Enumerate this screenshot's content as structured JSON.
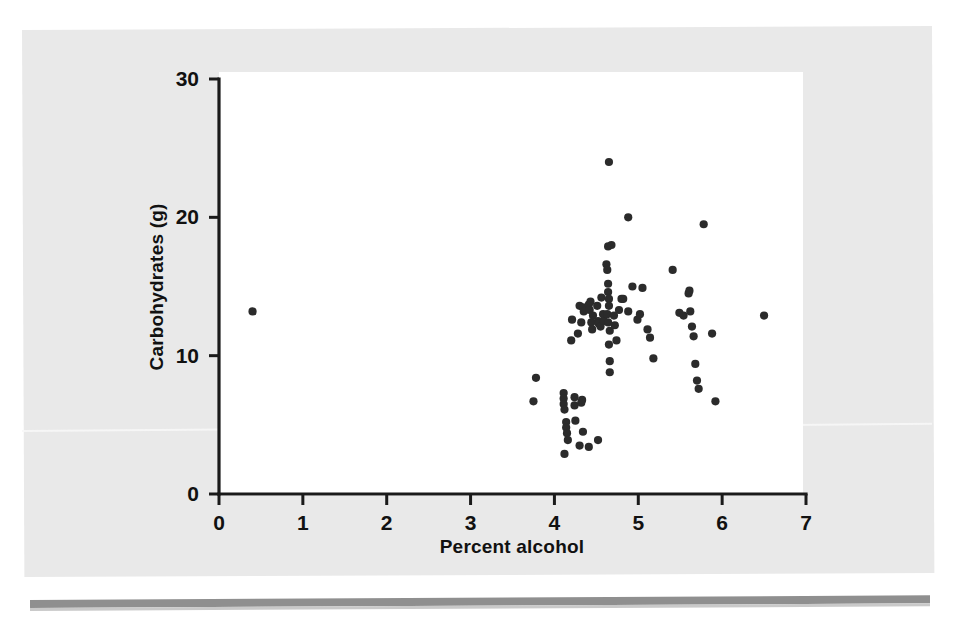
{
  "figure": {
    "background_color": "#e9e9e9",
    "plot_background_color": "#ffffff",
    "point_color": "#2b2b2b",
    "axis_color": "#1a1a1a"
  },
  "axes": {
    "x_title": "Percent alcohol",
    "y_title": "Carbohydrates (g)",
    "x_ticks": [
      "0",
      "1",
      "2",
      "3",
      "4",
      "5",
      "6",
      "7"
    ],
    "y_ticks": [
      "0",
      "10",
      "20",
      "30"
    ]
  },
  "chart_data": {
    "type": "scatter",
    "title": "",
    "xlabel": "Percent alcohol",
    "ylabel": "Carbohydrates (g)",
    "xlim": [
      0,
      7
    ],
    "ylim": [
      0,
      30
    ],
    "xticks": [
      0,
      1,
      2,
      3,
      4,
      5,
      6,
      7
    ],
    "yticks": [
      0,
      10,
      20,
      30
    ],
    "grid": false,
    "legend": "none",
    "marker": "filled-circle",
    "n_points": 86,
    "points": [
      [
        0.4,
        13.2
      ],
      [
        3.78,
        8.4
      ],
      [
        3.75,
        6.7
      ],
      [
        4.11,
        7.3
      ],
      [
        4.11,
        6.9
      ],
      [
        4.11,
        6.5
      ],
      [
        4.12,
        6.1
      ],
      [
        4.14,
        5.2
      ],
      [
        4.14,
        4.8
      ],
      [
        4.15,
        4.4
      ],
      [
        4.16,
        3.9
      ],
      [
        4.12,
        2.9
      ],
      [
        4.24,
        7.0
      ],
      [
        4.24,
        6.4
      ],
      [
        4.25,
        5.3
      ],
      [
        4.32,
        6.6
      ],
      [
        4.33,
        6.8
      ],
      [
        4.34,
        4.5
      ],
      [
        4.3,
        3.5
      ],
      [
        4.41,
        3.4
      ],
      [
        4.52,
        3.9
      ],
      [
        4.28,
        11.6
      ],
      [
        4.3,
        13.6
      ],
      [
        4.32,
        12.4
      ],
      [
        4.34,
        13.5
      ],
      [
        4.35,
        13.2
      ],
      [
        4.21,
        12.6
      ],
      [
        4.2,
        11.1
      ],
      [
        4.41,
        13.7
      ],
      [
        4.42,
        13.3
      ],
      [
        4.43,
        13.9
      ],
      [
        4.44,
        12.4
      ],
      [
        4.45,
        11.9
      ],
      [
        4.46,
        12.9
      ],
      [
        4.51,
        13.6
      ],
      [
        4.52,
        12.5
      ],
      [
        4.53,
        12.3
      ],
      [
        4.55,
        12.1
      ],
      [
        4.56,
        14.2
      ],
      [
        4.58,
        13.0
      ],
      [
        4.59,
        12.5
      ],
      [
        4.62,
        16.6
      ],
      [
        4.63,
        16.2
      ],
      [
        4.64,
        15.2
      ],
      [
        4.64,
        14.6
      ],
      [
        4.65,
        14.1
      ],
      [
        4.65,
        13.6
      ],
      [
        4.63,
        13.0
      ],
      [
        4.64,
        12.4
      ],
      [
        4.66,
        11.8
      ],
      [
        4.65,
        10.8
      ],
      [
        4.66,
        9.6
      ],
      [
        4.66,
        8.8
      ],
      [
        4.64,
        17.9
      ],
      [
        4.68,
        18.0
      ],
      [
        4.65,
        24.0
      ],
      [
        4.71,
        12.9
      ],
      [
        4.72,
        12.2
      ],
      [
        4.74,
        11.1
      ],
      [
        4.77,
        13.3
      ],
      [
        4.8,
        14.1
      ],
      [
        4.82,
        14.1
      ],
      [
        4.88,
        20.0
      ],
      [
        4.88,
        13.2
      ],
      [
        4.93,
        15.0
      ],
      [
        4.99,
        12.6
      ],
      [
        5.02,
        13.0
      ],
      [
        5.05,
        14.9
      ],
      [
        5.11,
        11.9
      ],
      [
        5.14,
        11.3
      ],
      [
        5.18,
        9.8
      ],
      [
        5.41,
        16.2
      ],
      [
        5.49,
        13.1
      ],
      [
        5.54,
        12.9
      ],
      [
        5.6,
        14.5
      ],
      [
        5.61,
        14.7
      ],
      [
        5.62,
        13.2
      ],
      [
        5.64,
        12.1
      ],
      [
        5.66,
        11.4
      ],
      [
        5.68,
        9.4
      ],
      [
        5.7,
        8.2
      ],
      [
        5.72,
        7.6
      ],
      [
        5.78,
        19.5
      ],
      [
        5.88,
        11.6
      ],
      [
        5.92,
        6.7
      ],
      [
        6.5,
        12.9
      ]
    ]
  }
}
